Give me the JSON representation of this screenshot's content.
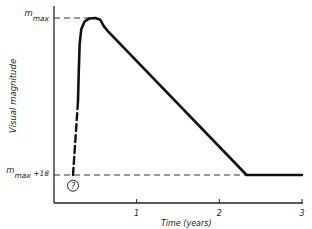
{
  "chart_data": {
    "type": "line",
    "title": "",
    "xlabel": "Time  (years)",
    "ylabel": "Visual magnitude",
    "xlim": [
      0,
      3
    ],
    "x_ticks": [
      1,
      2,
      3
    ],
    "x_tick_labels": [
      "1",
      "2",
      "3"
    ],
    "y_reference_labels": [
      {
        "name": "m_max",
        "base": "m",
        "sub": "max",
        "suffix": "",
        "value": 0
      },
      {
        "name": "m_max+18",
        "base": "m",
        "sub": "max",
        "suffix": " +18",
        "value": 18
      }
    ],
    "ylim": [
      19.7,
      -1.2
    ],
    "grid": false,
    "series": [
      {
        "name": "light-curve-solid",
        "style": "solid",
        "points": [
          [
            0.29,
            9.6
          ],
          [
            0.3,
            6
          ],
          [
            0.31,
            3
          ],
          [
            0.33,
            1.3
          ],
          [
            0.37,
            0.4
          ],
          [
            0.43,
            0.05
          ],
          [
            0.5,
            0
          ],
          [
            0.56,
            0.2
          ],
          [
            0.6,
            0.9
          ],
          [
            0.66,
            1.6
          ],
          [
            2.33,
            18
          ],
          [
            3.0,
            18
          ]
        ]
      },
      {
        "name": "light-curve-uncertain-rise",
        "style": "dashed",
        "points": [
          [
            0.23,
            18
          ],
          [
            0.29,
            9.6
          ]
        ]
      }
    ],
    "annotations": [
      {
        "name": "unknown-marker",
        "text": "?",
        "x": 0.23,
        "y": 19.0
      },
      {
        "name": "m_max-guide",
        "type": "dashed-hline",
        "y": 0,
        "x_from": 0,
        "x_to": 0.45
      },
      {
        "name": "m_max+18-guide",
        "type": "dashed-hline",
        "y": 18,
        "x_from": 0,
        "x_to": 2.33
      }
    ]
  }
}
